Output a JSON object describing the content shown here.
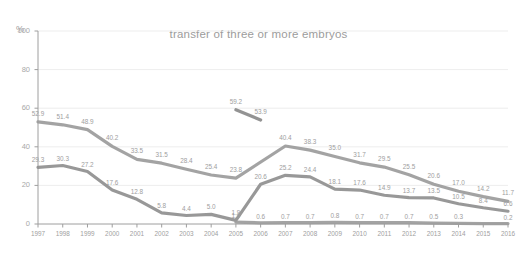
{
  "chart_data": {
    "type": "line",
    "title": "transfer of three or more embryos",
    "xlabel": "",
    "ylabel": "%",
    "ylim": [
      0,
      100
    ],
    "yticks": [
      0,
      20,
      40,
      60,
      80,
      100
    ],
    "grid": true,
    "legend": "none",
    "categories": [
      "1997",
      "1998",
      "1999",
      "2000",
      "2001",
      "2002",
      "2003",
      "2004",
      "2005",
      "2006",
      "2007",
      "2008",
      "2009",
      "2010",
      "2011",
      "2012",
      "2013",
      "2014",
      "2015",
      "2016"
    ],
    "series": [
      {
        "name": "series-upper",
        "color": "#9b9b9b",
        "x": [
          "1997",
          "1998",
          "1999",
          "2000",
          "2001",
          "2002",
          "2003",
          "2004",
          "2005",
          "2006",
          "2007",
          "2008",
          "2009",
          "2010",
          "2011",
          "2012",
          "2013",
          "2014",
          "2015",
          "2016"
        ],
        "values": [
          52.9,
          51.4,
          48.9,
          40.2,
          33.5,
          31.5,
          28.4,
          25.4,
          23.8,
          null,
          40.4,
          38.3,
          35.0,
          31.7,
          29.5,
          25.5,
          20.6,
          17.0,
          14.2,
          11.7
        ],
        "labels": [
          "52.9",
          "51.4",
          "48.9",
          "40.2",
          "33.5",
          "31.5",
          "28.4",
          "25.4",
          "23.8",
          "",
          "40.4",
          "38.3",
          "35.0",
          "31.7",
          "29.5",
          "25.5",
          "20.6",
          "17.0",
          "14.2",
          "11.7"
        ]
      },
      {
        "name": "series-middle",
        "color": "#8f8f8f",
        "x": [
          "1997",
          "1998",
          "1999",
          "2000",
          "2001",
          "2002",
          "2003",
          "2004",
          "2005",
          "2006",
          "2007",
          "2008",
          "2009",
          "2010",
          "2011",
          "2012",
          "2013",
          "2014",
          "2015",
          "2016"
        ],
        "values": [
          29.3,
          30.3,
          27.2,
          17.6,
          12.8,
          5.8,
          4.4,
          5.0,
          1.9,
          20.6,
          25.2,
          24.4,
          18.1,
          17.6,
          14.9,
          13.7,
          13.5,
          10.5,
          8.4,
          6.6
        ],
        "labels": [
          "29.3",
          "30.3",
          "27.2",
          "17.6",
          "12.8",
          "5.8",
          "4.4",
          "5.0",
          "1.9",
          "20.6",
          "25.2",
          "24.4",
          "18.1",
          "17.6",
          "14.9",
          "13.7",
          "13.5",
          "10.5",
          "8.4",
          "6.6"
        ]
      },
      {
        "name": "series-peak",
        "color": "#8a8a8a",
        "x": [
          "2005",
          "2006"
        ],
        "values": [
          59.2,
          53.9
        ],
        "labels": [
          "59.2",
          "53.9"
        ]
      },
      {
        "name": "series-lower",
        "color": "#9b9b9b",
        "x": [
          "2005",
          "2006",
          "2007",
          "2008",
          "2009",
          "2010",
          "2011",
          "2012",
          "2013",
          "2014",
          "2015",
          "2016"
        ],
        "values": [
          1.0,
          0.6,
          0.7,
          0.7,
          0.8,
          0.7,
          0.7,
          0.7,
          0.5,
          0.3,
          0.2,
          0.2
        ],
        "labels": [
          "1.0",
          "0.6",
          "0.7",
          "0.7",
          "0.8",
          "0.7",
          "0.7",
          "0.7",
          "0.5",
          "0.3",
          "",
          "0.2"
        ]
      }
    ]
  },
  "axis": {
    "unit_label": "%",
    "ytick_labels": [
      "100",
      "80",
      "60",
      "40",
      "20",
      "0"
    ],
    "y_percent_mark": "%"
  }
}
